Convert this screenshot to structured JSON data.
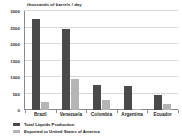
{
  "chart_data": {
    "type": "bar",
    "title": "",
    "ylabel": "thousands of barrels / day",
    "xlabel": "",
    "categories": [
      "Brazil",
      "Venezuela",
      "Colombia",
      "Argentina",
      "Ecuador"
    ],
    "series": [
      {
        "name": "Total Liquids Production",
        "color": "#4a4a4a",
        "values": [
          2750,
          2450,
          770,
          730,
          460
        ]
      },
      {
        "name": "Exported to United States of America",
        "color": "#b5b5b5",
        "values": [
          250,
          950,
          310,
          30,
          180
        ]
      }
    ],
    "ylim": [
      0,
      3000
    ],
    "yticks": [
      0,
      500,
      1000,
      1500,
      2000,
      2500,
      3000
    ],
    "ytick_labels": [
      "0",
      "500",
      "1000",
      "1500",
      "2000",
      "2500",
      "3000"
    ],
    "grid": true,
    "legend_position": "bottom-left"
  }
}
